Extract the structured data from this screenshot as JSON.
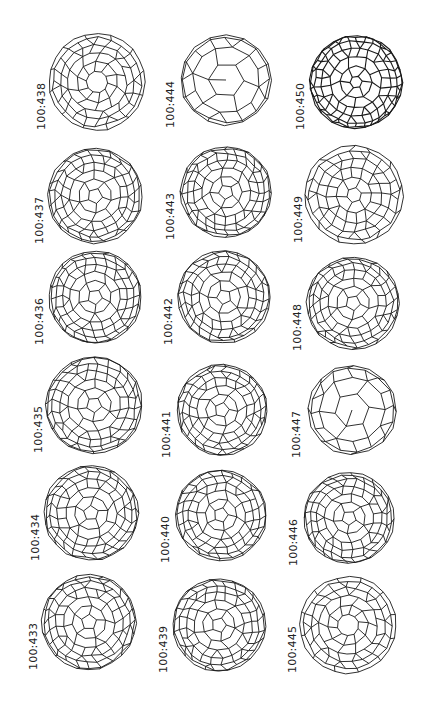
{
  "figure": {
    "layout": {
      "columns": 3,
      "rows": 6
    },
    "line_color": "#1a1a1a",
    "columns": [
      {
        "items": [
          {
            "label": "100:438",
            "style": "ring",
            "cx": 97,
            "cy": 82,
            "r": 49
          },
          {
            "label": "100:437",
            "style": "mixed",
            "cx": 95,
            "cy": 196,
            "r": 48
          },
          {
            "label": "100:436",
            "style": "mixed",
            "cx": 95,
            "cy": 297,
            "r": 47
          },
          {
            "label": "100:435",
            "style": "mixed",
            "cx": 94,
            "cy": 405,
            "r": 49
          },
          {
            "label": "100:434",
            "style": "mixed",
            "cx": 91,
            "cy": 513,
            "r": 48
          },
          {
            "label": "100:433",
            "style": "mixed",
            "cx": 89,
            "cy": 622,
            "r": 48
          }
        ]
      },
      {
        "items": [
          {
            "label": "100:444",
            "style": "large",
            "cx": 226,
            "cy": 80,
            "r": 46
          },
          {
            "label": "100:443",
            "style": "mixed",
            "cx": 226,
            "cy": 192,
            "r": 46
          },
          {
            "label": "100:442",
            "style": "mixed",
            "cx": 224,
            "cy": 297,
            "r": 47
          },
          {
            "label": "100:441",
            "style": "mixed",
            "cx": 222,
            "cy": 410,
            "r": 46
          },
          {
            "label": "100:440",
            "style": "mixed",
            "cx": 221,
            "cy": 515,
            "r": 46
          },
          {
            "label": "100:439",
            "style": "mixed",
            "cx": 219,
            "cy": 625,
            "r": 47
          }
        ]
      },
      {
        "items": [
          {
            "label": "100:450",
            "style": "dense",
            "cx": 356,
            "cy": 82,
            "r": 47
          },
          {
            "label": "100:449",
            "style": "bands",
            "cx": 354,
            "cy": 195,
            "r": 50
          },
          {
            "label": "100:448",
            "style": "mixed",
            "cx": 353,
            "cy": 303,
            "r": 47
          },
          {
            "label": "100:447",
            "style": "large",
            "cx": 352,
            "cy": 410,
            "r": 45
          },
          {
            "label": "100:446",
            "style": "mixed",
            "cx": 349,
            "cy": 518,
            "r": 46
          },
          {
            "label": "100:445",
            "style": "ring",
            "cx": 348,
            "cy": 625,
            "r": 49
          }
        ]
      }
    ],
    "label_offsets": {
      "dx": -62,
      "dy": 44
    }
  }
}
